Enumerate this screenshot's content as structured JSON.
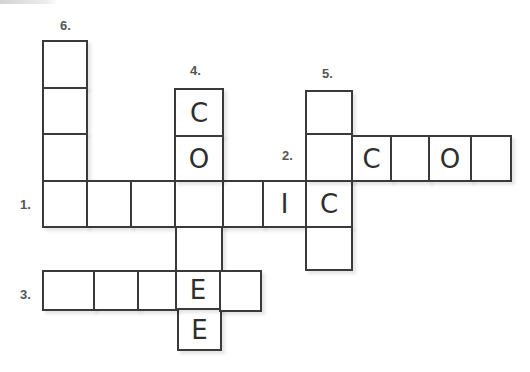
{
  "puzzle": {
    "clues": [
      {
        "number": "1.",
        "direction": "across",
        "x": 20,
        "y": 197
      },
      {
        "number": "2.",
        "direction": "across",
        "x": 282,
        "y": 148
      },
      {
        "number": "3.",
        "direction": "across",
        "x": 20,
        "y": 287
      },
      {
        "number": "4.",
        "direction": "down",
        "x": 190,
        "y": 63
      },
      {
        "number": "5.",
        "direction": "down",
        "x": 322,
        "y": 66
      },
      {
        "number": "6.",
        "direction": "down",
        "x": 60,
        "y": 18
      }
    ],
    "cells": [
      {
        "id": "d6-1",
        "x": 42,
        "y": 40,
        "w": 46,
        "h": 49,
        "letter": ""
      },
      {
        "id": "d6-2",
        "x": 42,
        "y": 87,
        "w": 46,
        "h": 48,
        "letter": ""
      },
      {
        "id": "d6-3",
        "x": 42,
        "y": 133,
        "w": 46,
        "h": 49,
        "letter": ""
      },
      {
        "id": "a1-1",
        "x": 42,
        "y": 180,
        "w": 46,
        "h": 48,
        "letter": ""
      },
      {
        "id": "a1-2",
        "x": 86,
        "y": 180,
        "w": 46,
        "h": 48,
        "letter": ""
      },
      {
        "id": "a1-3",
        "x": 130,
        "y": 180,
        "w": 46,
        "h": 48,
        "letter": ""
      },
      {
        "id": "a1-4",
        "x": 174,
        "y": 180,
        "w": 50,
        "h": 48,
        "letter": ""
      },
      {
        "id": "a1-5",
        "x": 222,
        "y": 180,
        "w": 42,
        "h": 48,
        "letter": ""
      },
      {
        "id": "a1-6",
        "x": 262,
        "y": 180,
        "w": 45,
        "h": 48,
        "letter": "I"
      },
      {
        "id": "a1-7",
        "x": 305,
        "y": 180,
        "w": 48,
        "h": 48,
        "letter": "C"
      },
      {
        "id": "d4-1",
        "x": 174,
        "y": 88,
        "w": 50,
        "h": 49,
        "letter": "C"
      },
      {
        "id": "d4-2",
        "x": 174,
        "y": 135,
        "w": 50,
        "h": 47,
        "letter": "O"
      },
      {
        "id": "d4-4",
        "x": 175,
        "y": 226,
        "w": 48,
        "h": 46,
        "letter": ""
      },
      {
        "id": "d4-6",
        "x": 177,
        "y": 308,
        "w": 45,
        "h": 43,
        "letter": "E"
      },
      {
        "id": "d5-1",
        "x": 305,
        "y": 90,
        "w": 48,
        "h": 45,
        "letter": ""
      },
      {
        "id": "a2-1",
        "x": 305,
        "y": 133,
        "w": 48,
        "h": 49,
        "letter": ""
      },
      {
        "id": "d5-4",
        "x": 305,
        "y": 226,
        "w": 48,
        "h": 45,
        "letter": ""
      },
      {
        "id": "a2-2",
        "x": 351,
        "y": 135,
        "w": 41,
        "h": 47,
        "letter": "C"
      },
      {
        "id": "a2-3",
        "x": 390,
        "y": 135,
        "w": 40,
        "h": 47,
        "letter": ""
      },
      {
        "id": "a2-4",
        "x": 428,
        "y": 135,
        "w": 44,
        "h": 47,
        "letter": "O"
      },
      {
        "id": "a2-5",
        "x": 470,
        "y": 135,
        "w": 42,
        "h": 47,
        "letter": ""
      },
      {
        "id": "a3-1",
        "x": 42,
        "y": 270,
        "w": 53,
        "h": 41,
        "letter": ""
      },
      {
        "id": "a3-2",
        "x": 93,
        "y": 270,
        "w": 46,
        "h": 41,
        "letter": ""
      },
      {
        "id": "a3-3",
        "x": 137,
        "y": 270,
        "w": 40,
        "h": 41,
        "letter": ""
      },
      {
        "id": "a3-4",
        "x": 175,
        "y": 270,
        "w": 46,
        "h": 40,
        "letter": "E"
      },
      {
        "id": "a3-5",
        "x": 219,
        "y": 270,
        "w": 43,
        "h": 42,
        "letter": ""
      }
    ]
  },
  "colors": {
    "line": "#3a3a3a",
    "number": "#555555",
    "letter": "#2e2e2e"
  }
}
